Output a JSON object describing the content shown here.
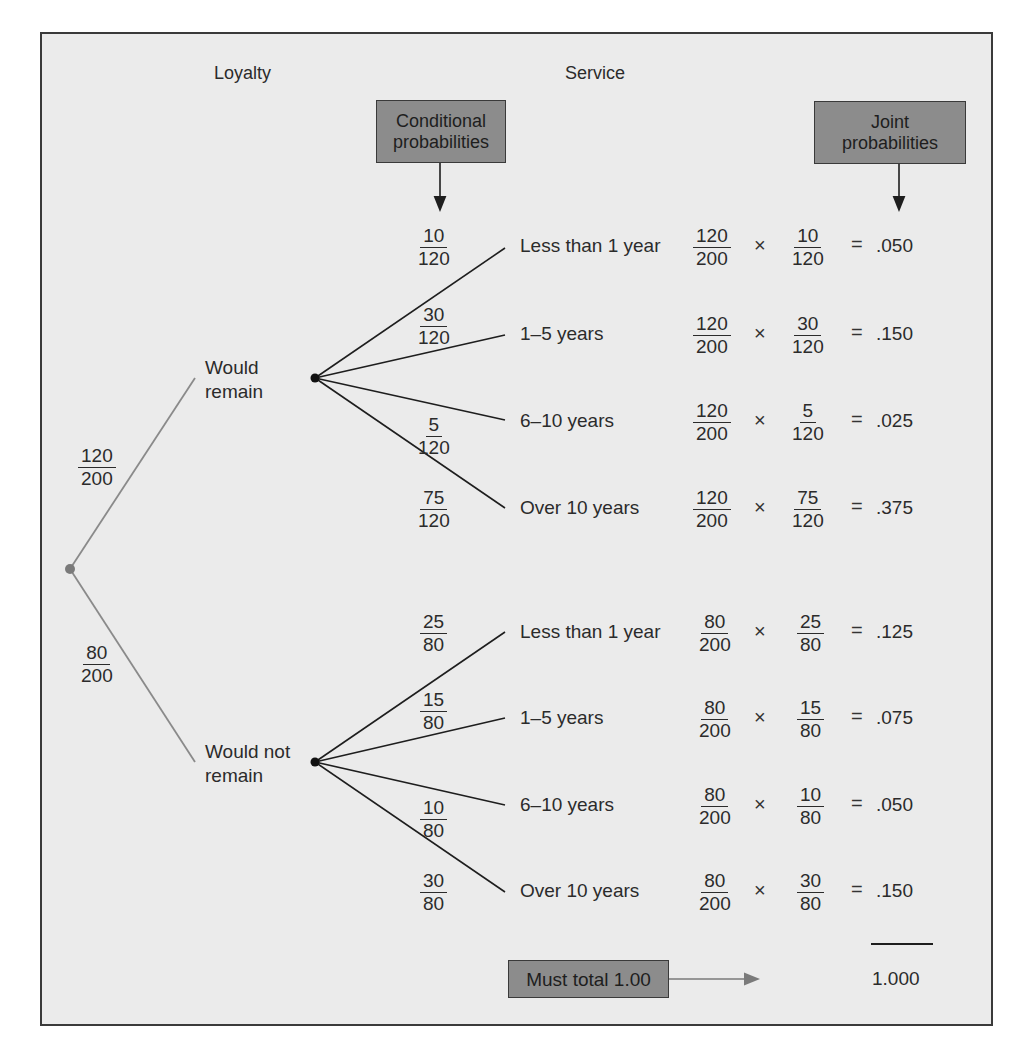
{
  "headers": {
    "loyalty": "Loyalty",
    "service": "Service"
  },
  "callouts": {
    "conditional": {
      "line1": "Conditional",
      "line2": "probabilities"
    },
    "joint": {
      "line1": "Joint",
      "line2": "probabilities"
    },
    "total": "Must total 1.00"
  },
  "loyalty_branches": [
    {
      "label_line1": "Would",
      "label_line2": "remain",
      "prob_num": "120",
      "prob_den": "200"
    },
    {
      "label_line1": "Would not",
      "label_line2": "remain",
      "prob_num": "80",
      "prob_den": "200"
    }
  ],
  "service_branches": {
    "remain": [
      {
        "label": "Less than 1 year",
        "cond_num": "10",
        "cond_den": "120",
        "p1_num": "120",
        "p1_den": "200",
        "p2_num": "10",
        "p2_den": "120",
        "joint": ".050"
      },
      {
        "label": "1–5 years",
        "cond_num": "30",
        "cond_den": "120",
        "p1_num": "120",
        "p1_den": "200",
        "p2_num": "30",
        "p2_den": "120",
        "joint": ".150"
      },
      {
        "label": "6–10 years",
        "cond_num": "5",
        "cond_den": "120",
        "p1_num": "120",
        "p1_den": "200",
        "p2_num": "5",
        "p2_den": "120",
        "joint": ".025"
      },
      {
        "label": "Over 10 years",
        "cond_num": "75",
        "cond_den": "120",
        "p1_num": "120",
        "p1_den": "200",
        "p2_num": "75",
        "p2_den": "120",
        "joint": ".375"
      }
    ],
    "not_remain": [
      {
        "label": "Less than 1 year",
        "cond_num": "25",
        "cond_den": "80",
        "p1_num": "80",
        "p1_den": "200",
        "p2_num": "25",
        "p2_den": "80",
        "joint": ".125"
      },
      {
        "label": "1–5 years",
        "cond_num": "15",
        "cond_den": "80",
        "p1_num": "80",
        "p1_den": "200",
        "p2_num": "15",
        "p2_den": "80",
        "joint": ".075"
      },
      {
        "label": "6–10 years",
        "cond_num": "10",
        "cond_den": "80",
        "p1_num": "80",
        "p1_den": "200",
        "p2_num": "10",
        "p2_den": "80",
        "joint": ".050"
      },
      {
        "label": "Over 10 years",
        "cond_num": "30",
        "cond_den": "80",
        "p1_num": "80",
        "p1_den": "200",
        "p2_num": "30",
        "p2_den": "80",
        "joint": ".150"
      }
    ]
  },
  "symbols": {
    "times": "×",
    "equals": "="
  },
  "total_value": "1.000",
  "colors": {
    "frame_bg": "#ebebeb",
    "callout_bg": "#8c8c8c",
    "root_node": "#7a7a7a",
    "branch_line_gray": "#8a8a8a",
    "branch_line_dark": "#1e1e1e"
  }
}
